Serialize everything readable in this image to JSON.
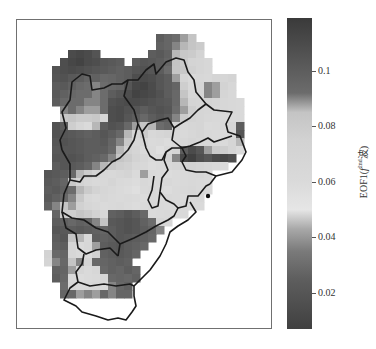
{
  "chart_data": {
    "type": "heatmap",
    "title": "",
    "colorbar": {
      "label_prefix": "EOF1(",
      "label_sup": "2nd",
      "label_f": "f",
      "label_suffix": "波)",
      "label": "EOF1(f^2nd波)",
      "vmin": 0.007,
      "vmax": 0.119,
      "ticks": [
        0.1,
        0.08,
        0.06,
        0.04,
        0.02
      ],
      "tick_labels": [
        "0.1",
        "0.08",
        "0.06",
        "0.04",
        "0.02"
      ],
      "colormap_stops": [
        {
          "v": 0.007,
          "color": "#404040"
        },
        {
          "v": 0.025,
          "color": "#5e5e5e"
        },
        {
          "v": 0.035,
          "color": "#7a7a7a"
        },
        {
          "v": 0.043,
          "color": "#a8a8a8"
        },
        {
          "v": 0.05,
          "color": "#e6e6e6"
        },
        {
          "v": 0.06,
          "color": "#dadada"
        },
        {
          "v": 0.075,
          "color": "#d2d2d2"
        },
        {
          "v": 0.085,
          "color": "#c4c4c4"
        },
        {
          "v": 0.092,
          "color": "#6c6c6c"
        },
        {
          "v": 0.119,
          "color": "#3a3a3a"
        }
      ]
    },
    "grid": {
      "origin_x": 36,
      "origin_y": 34,
      "cell": 8,
      "note": "values per cell, null = no data (outside region)",
      "values": [
        [
          null,
          null,
          null,
          null,
          null,
          null,
          null,
          null,
          null,
          null,
          null,
          null,
          null,
          null,
          null,
          0.1,
          0.095,
          0.092,
          0.088,
          0.085,
          null,
          null,
          null,
          null,
          null,
          null,
          null,
          null
        ],
        [
          null,
          null,
          null,
          null,
          null,
          null,
          null,
          null,
          null,
          null,
          null,
          null,
          null,
          null,
          null,
          0.098,
          0.095,
          0.09,
          0.086,
          0.084,
          0.08,
          null,
          null,
          null,
          null,
          null,
          null,
          null
        ],
        [
          null,
          null,
          null,
          null,
          0.11,
          0.112,
          0.11,
          0.105,
          null,
          null,
          null,
          null,
          null,
          null,
          0.1,
          0.102,
          0.098,
          0.086,
          0.082,
          0.08,
          0.074,
          null,
          null,
          null,
          null,
          null,
          null,
          null
        ],
        [
          null,
          null,
          null,
          0.108,
          0.112,
          0.114,
          0.11,
          0.108,
          0.104,
          0.102,
          0.1,
          null,
          0.1,
          0.104,
          0.102,
          0.1,
          0.096,
          0.085,
          0.08,
          0.072,
          0.07,
          0.065,
          null,
          null,
          null,
          null,
          null,
          null
        ],
        [
          null,
          null,
          0.105,
          0.108,
          0.11,
          0.108,
          0.106,
          0.104,
          0.102,
          0.1,
          0.098,
          0.1,
          0.104,
          0.106,
          0.104,
          0.1,
          0.092,
          0.084,
          0.082,
          0.076,
          0.07,
          0.066,
          null,
          null,
          null,
          null,
          null,
          null
        ],
        [
          null,
          null,
          0.104,
          0.106,
          0.102,
          0.1,
          0.096,
          0.098,
          0.094,
          0.095,
          0.098,
          0.1,
          0.108,
          0.11,
          0.108,
          0.104,
          0.1,
          0.088,
          0.07,
          0.062,
          0.066,
          0.064,
          0.07,
          0.068,
          0.072,
          null,
          null,
          null
        ],
        [
          null,
          null,
          0.1,
          0.102,
          0.098,
          0.094,
          0.092,
          0.09,
          0.092,
          0.094,
          0.096,
          0.104,
          0.112,
          0.114,
          0.11,
          0.104,
          0.1,
          0.096,
          0.078,
          0.064,
          0.07,
          0.09,
          0.088,
          0.074,
          0.066,
          null,
          null,
          null
        ],
        [
          null,
          null,
          0.102,
          0.098,
          0.094,
          0.092,
          0.092,
          0.09,
          0.092,
          0.1,
          0.104,
          0.108,
          0.114,
          0.112,
          0.11,
          0.106,
          0.1,
          0.094,
          0.084,
          0.066,
          0.07,
          0.09,
          0.088,
          0.07,
          0.064,
          null,
          null,
          null
        ],
        [
          null,
          null,
          0.1,
          0.094,
          0.092,
          0.092,
          0.09,
          0.09,
          0.092,
          0.106,
          0.108,
          0.11,
          0.11,
          0.108,
          0.106,
          0.104,
          0.102,
          0.094,
          0.086,
          0.072,
          0.07,
          0.074,
          0.07,
          0.066,
          0.064,
          0.062,
          null,
          null
        ],
        [
          null,
          null,
          null,
          0.09,
          0.092,
          0.09,
          0.088,
          0.088,
          0.092,
          0.108,
          0.11,
          0.106,
          0.104,
          0.1,
          0.104,
          0.106,
          0.104,
          0.092,
          0.088,
          0.078,
          0.07,
          0.068,
          0.066,
          0.066,
          0.064,
          0.062,
          null,
          null
        ],
        [
          null,
          null,
          null,
          0.082,
          0.084,
          0.08,
          0.08,
          0.082,
          0.065,
          0.108,
          0.11,
          0.104,
          0.1,
          0.094,
          0.1,
          0.104,
          0.1,
          0.09,
          0.08,
          0.074,
          0.07,
          0.066,
          0.064,
          0.062,
          0.06,
          0.062,
          null,
          null
        ],
        [
          null,
          null,
          0.106,
          0.1,
          0.078,
          0.068,
          0.06,
          0.086,
          0.1,
          0.106,
          0.104,
          0.094,
          0.088,
          0.084,
          0.086,
          0.092,
          0.096,
          0.07,
          0.064,
          0.068,
          0.07,
          0.06,
          0.062,
          0.064,
          0.068,
          0.1,
          null,
          null
        ],
        [
          null,
          null,
          0.106,
          0.104,
          0.102,
          0.1,
          0.098,
          0.1,
          0.104,
          0.1,
          0.094,
          0.086,
          0.07,
          0.08,
          0.064,
          0.068,
          0.072,
          0.064,
          0.062,
          0.066,
          0.07,
          0.064,
          0.062,
          0.06,
          0.064,
          0.104,
          null,
          null
        ],
        [
          null,
          null,
          0.104,
          0.106,
          0.104,
          0.102,
          0.1,
          0.1,
          0.102,
          0.096,
          0.09,
          0.082,
          0.066,
          0.068,
          0.06,
          0.062,
          0.058,
          0.064,
          0.066,
          0.07,
          0.066,
          0.064,
          0.062,
          0.06,
          0.07,
          0.086,
          null,
          null
        ],
        [
          null,
          null,
          0.102,
          0.104,
          0.104,
          0.102,
          0.1,
          0.1,
          0.1,
          0.094,
          0.086,
          0.076,
          0.07,
          0.06,
          0.062,
          0.056,
          0.062,
          0.07,
          0.1,
          0.11,
          0.104,
          0.088,
          0.08,
          0.078,
          0.07,
          0.06,
          null,
          null
        ],
        [
          null,
          null,
          0.104,
          0.104,
          0.106,
          0.104,
          0.1,
          0.098,
          0.094,
          0.09,
          0.084,
          0.08,
          0.074,
          0.068,
          0.06,
          0.062,
          0.072,
          0.09,
          0.112,
          0.116,
          0.108,
          0.104,
          0.11,
          0.112,
          0.108,
          null,
          null,
          null
        ],
        [
          null,
          null,
          0.1,
          0.104,
          0.102,
          0.1,
          0.096,
          0.09,
          0.086,
          0.082,
          0.078,
          0.076,
          0.066,
          0.064,
          0.058,
          0.06,
          0.064,
          0.068,
          0.072,
          0.074,
          0.07,
          0.066,
          0.062,
          0.06,
          null,
          null,
          null,
          null
        ],
        [
          null,
          0.104,
          0.102,
          0.1,
          0.094,
          0.086,
          0.08,
          0.074,
          0.066,
          0.064,
          0.068,
          0.072,
          0.06,
          0.088,
          0.062,
          0.06,
          0.058,
          0.06,
          0.062,
          0.064,
          0.066,
          0.062,
          null,
          null,
          null,
          null,
          null,
          null
        ],
        [
          null,
          0.102,
          0.1,
          0.096,
          0.082,
          0.074,
          0.066,
          0.062,
          0.064,
          0.07,
          0.062,
          0.06,
          0.058,
          0.064,
          0.06,
          0.062,
          0.064,
          0.06,
          0.062,
          0.064,
          0.062,
          0.06,
          null,
          null,
          null,
          null,
          null,
          null
        ],
        [
          null,
          0.1,
          0.102,
          0.098,
          0.092,
          0.086,
          0.08,
          0.074,
          0.068,
          0.064,
          0.06,
          0.058,
          0.056,
          0.062,
          0.064,
          0.06,
          0.058,
          0.062,
          0.064,
          0.066,
          0.062,
          0.06,
          null,
          null,
          null,
          null,
          null,
          null
        ],
        [
          null,
          0.102,
          0.098,
          0.094,
          0.09,
          0.082,
          0.064,
          0.06,
          0.066,
          0.062,
          0.06,
          0.062,
          0.06,
          0.058,
          0.062,
          0.06,
          0.064,
          0.062,
          0.06,
          0.062,
          0.064,
          null,
          null,
          null,
          null,
          null,
          null,
          null
        ],
        [
          null,
          0.098,
          0.09,
          0.084,
          0.088,
          0.076,
          0.068,
          0.064,
          0.06,
          0.062,
          0.064,
          0.06,
          0.058,
          0.06,
          0.064,
          0.062,
          0.06,
          0.062,
          0.064,
          0.062,
          0.06,
          null,
          null,
          null,
          null,
          null,
          null,
          null
        ],
        [
          null,
          null,
          0.096,
          0.08,
          0.078,
          0.084,
          0.08,
          0.074,
          0.064,
          0.098,
          0.1,
          0.104,
          0.1,
          0.094,
          0.06,
          0.062,
          0.064,
          0.06,
          0.062,
          null,
          null,
          null,
          null,
          null,
          null,
          null,
          null,
          null
        ],
        [
          null,
          null,
          0.1,
          0.098,
          0.094,
          0.098,
          0.096,
          0.09,
          0.084,
          0.102,
          0.104,
          0.106,
          0.104,
          0.098,
          0.092,
          0.07,
          0.064,
          null,
          null,
          null,
          null,
          null,
          null,
          null,
          null,
          null,
          null,
          null
        ],
        [
          null,
          null,
          0.104,
          0.102,
          0.1,
          0.102,
          0.1,
          0.098,
          0.096,
          0.1,
          0.104,
          0.106,
          0.104,
          0.1,
          0.096,
          0.09,
          null,
          null,
          null,
          null,
          null,
          null,
          null,
          null,
          null,
          null,
          null,
          null
        ],
        [
          null,
          null,
          0.1,
          0.104,
          0.084,
          0.086,
          0.064,
          0.1,
          0.098,
          0.1,
          0.104,
          0.102,
          0.1,
          0.098,
          0.094,
          null,
          null,
          null,
          null,
          null,
          null,
          null,
          null,
          null,
          null,
          null,
          null,
          null
        ],
        [
          null,
          null,
          0.098,
          0.1,
          0.07,
          0.06,
          0.066,
          0.088,
          0.1,
          0.102,
          0.104,
          0.1,
          0.098,
          0.094,
          null,
          null,
          null,
          null,
          null,
          null,
          null,
          null,
          null,
          null,
          null,
          null,
          null,
          null
        ],
        [
          null,
          0.074,
          0.094,
          0.096,
          0.068,
          0.062,
          0.06,
          0.076,
          0.098,
          0.1,
          0.102,
          0.1,
          0.096,
          null,
          null,
          null,
          null,
          null,
          null,
          null,
          null,
          null,
          null,
          null,
          null,
          null,
          null,
          null
        ],
        [
          null,
          0.07,
          0.09,
          0.094,
          0.084,
          0.09,
          0.07,
          0.094,
          0.096,
          0.098,
          0.1,
          0.098,
          null,
          null,
          null,
          null,
          null,
          null,
          null,
          null,
          null,
          null,
          null,
          null,
          null,
          null,
          null,
          null
        ],
        [
          null,
          null,
          0.098,
          0.096,
          0.088,
          0.068,
          0.06,
          0.066,
          0.094,
          0.098,
          0.096,
          0.1,
          0.096,
          null,
          null,
          null,
          null,
          null,
          null,
          null,
          null,
          null,
          null,
          null,
          null,
          null,
          null,
          null
        ],
        [
          null,
          null,
          0.1,
          0.094,
          0.062,
          0.058,
          0.06,
          0.062,
          0.068,
          0.094,
          0.096,
          0.094,
          0.098,
          null,
          null,
          null,
          null,
          null,
          null,
          null,
          null,
          null,
          null,
          null,
          null,
          null,
          null,
          null
        ],
        [
          null,
          null,
          null,
          0.092,
          0.068,
          0.062,
          0.064,
          0.066,
          0.062,
          0.09,
          0.094,
          0.098,
          null,
          null,
          null,
          null,
          null,
          null,
          null,
          null,
          null,
          null,
          null,
          null,
          null,
          null,
          null,
          null
        ],
        [
          null,
          null,
          null,
          0.096,
          0.094,
          0.088,
          0.09,
          0.088,
          0.094,
          0.09,
          0.096,
          0.096,
          null,
          null,
          null,
          null,
          null,
          null,
          null,
          null,
          null,
          null,
          null,
          null,
          null,
          null,
          null,
          null
        ],
        [
          null,
          null,
          null,
          null,
          null,
          null,
          null,
          null,
          null,
          null,
          null,
          null,
          null,
          null,
          null,
          null,
          null,
          null,
          null,
          null,
          null,
          null,
          null,
          null,
          null,
          null,
          null,
          null
        ]
      ]
    },
    "xlabel": "",
    "ylabel": "",
    "grid_lines": false,
    "legend_position": "right (colorbar)"
  }
}
